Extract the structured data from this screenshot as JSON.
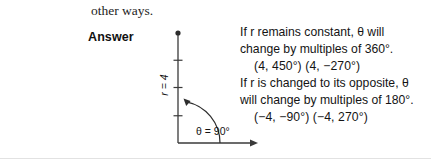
{
  "continuation": {
    "text": "other ways."
  },
  "answer": {
    "label": "Answer"
  },
  "diagram": {
    "radius_label": "r = 4",
    "angle_label": "θ = 90°",
    "tick_count": 4,
    "line_color": "#3a3a3a"
  },
  "explanation": {
    "lines": [
      {
        "text": "If r remains constant, θ will",
        "indent": false
      },
      {
        "text": "change by multiples of 360°.",
        "indent": false
      },
      {
        "text": "(4, 450°)   (4, −270°)",
        "indent": true
      },
      {
        "text": "If r is changed to its opposite, θ",
        "indent": false
      },
      {
        "text": "will change by multiples of 180°.",
        "indent": false
      },
      {
        "text": "(−4, −90°)   (−4, 270°)",
        "indent": true
      }
    ]
  }
}
